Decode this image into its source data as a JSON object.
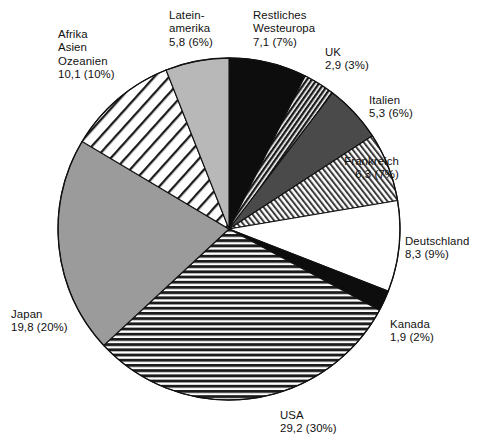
{
  "chart_data": {
    "type": "pie",
    "title": "",
    "subtitle": "",
    "xlabel": "",
    "ylabel": "",
    "legend_position": "callout-labels",
    "grid": false,
    "units": "Mio.",
    "value_decimal_separator": ",",
    "start_angle_deg": 0,
    "direction": "clockwise",
    "total_value": 97.7,
    "categories": [
      "Restliches Westeuropa",
      "UK",
      "Italien",
      "Frankreich",
      "Deutschland",
      "Kanada",
      "USA",
      "Japan",
      "Afrika Asien Ozeanien",
      "Lateinamerika"
    ],
    "values": [
      7.1,
      2.9,
      5.3,
      6.3,
      8.3,
      1.9,
      29.2,
      19.8,
      10.1,
      5.8
    ],
    "percents": [
      7,
      3,
      6,
      7,
      9,
      2,
      30,
      20,
      10,
      6
    ],
    "slices": [
      {
        "name": "Restliches Westeuropa",
        "label_lines": [
          "Restliches",
          "Westeuropa",
          "7,1 (7%)"
        ],
        "value": 7.1,
        "value_text": "7,1",
        "percent": 7,
        "percent_text": "(7%)",
        "fill": "solid-black",
        "color": "#0d0d0d"
      },
      {
        "name": "UK",
        "label_lines": [
          "UK",
          "2,9 (3%)"
        ],
        "value": 2.9,
        "value_text": "2,9",
        "percent": 3,
        "percent_text": "(3%)",
        "fill": "diagonal-dark-hatch",
        "color": "#2e2e2e"
      },
      {
        "name": "Italien",
        "label_lines": [
          "Italien",
          "5,3 (6%)"
        ],
        "value": 5.3,
        "value_text": "5,3",
        "percent": 6,
        "percent_text": "(6%)",
        "fill": "solid-dark-gray",
        "color": "#4a4a4a"
      },
      {
        "name": "Frankreich",
        "label_lines": [
          "Frankreich",
          "6,3 (7%)"
        ],
        "value": 6.3,
        "value_text": "6,3",
        "percent": 7,
        "percent_text": "(7%)",
        "fill": "diagonal-light-hatch",
        "color": "#9a9a9a"
      },
      {
        "name": "Deutschland",
        "label_lines": [
          "Deutschland",
          "8,3 (9%)"
        ],
        "value": 8.3,
        "value_text": "8,3",
        "percent": 9,
        "percent_text": "(9%)",
        "fill": "solid-white",
        "color": "#ffffff"
      },
      {
        "name": "Kanada",
        "label_lines": [
          "Kanada",
          "1,9 (2%)"
        ],
        "value": 1.9,
        "value_text": "1,9",
        "percent": 2,
        "percent_text": "(2%)",
        "fill": "solid-black",
        "color": "#0d0d0d"
      },
      {
        "name": "USA",
        "label_lines": [
          "USA",
          "29,2 (30%)"
        ],
        "value": 29.2,
        "value_text": "29,2",
        "percent": 30,
        "percent_text": "(30%)",
        "fill": "horizontal-lines",
        "color": "#8c8c8c"
      },
      {
        "name": "Japan",
        "label_lines": [
          "Japan",
          "19,8 (20%)"
        ],
        "value": 19.8,
        "value_text": "19,8",
        "percent": 20,
        "percent_text": "(20%)",
        "fill": "solid-medium-gray",
        "color": "#9b9b9b"
      },
      {
        "name": "Afrika Asien Ozeanien",
        "label_lines": [
          "Afrika",
          "Asien",
          "Ozeanien",
          "10,1 (10%)"
        ],
        "value": 10.1,
        "value_text": "10,1",
        "percent": 10,
        "percent_text": "(10%)",
        "fill": "wide-diagonal-stripes",
        "color": "#5a5a5a"
      },
      {
        "name": "Lateinamerika",
        "label_lines": [
          "Latein-",
          "amerika",
          "5,8 (6%)"
        ],
        "value": 5.8,
        "value_text": "5,8",
        "percent": 6,
        "percent_text": "(6%)",
        "fill": "solid-light-gray",
        "color": "#b8b8b8"
      }
    ]
  },
  "labels": {
    "westeuropa": {
      "l1": "Restliches",
      "l2": "Westeuropa",
      "l3": "7,1 (7%)"
    },
    "uk": {
      "l1": "UK",
      "l2": "2,9 (3%)"
    },
    "italien": {
      "l1": "Italien",
      "l2": "5,3 (6%)"
    },
    "frankreich": {
      "l1": "Frankreich",
      "l2": "6,3 (7%)"
    },
    "deutschland": {
      "l1": "Deutschland",
      "l2": "8,3 (9%)"
    },
    "kanada": {
      "l1": "Kanada",
      "l2": "1,9 (2%)"
    },
    "usa": {
      "l1": "USA",
      "l2": "29,2 (30%)"
    },
    "japan": {
      "l1": "Japan",
      "l2": "19,8 (20%)"
    },
    "afrika": {
      "l1": "Afrika",
      "l2": "Asien",
      "l3": "Ozeanien",
      "l4": "10,1 (10%)"
    },
    "lateinamerika": {
      "l1": "Latein-",
      "l2": "amerika",
      "l3": "5,8 (6%)"
    }
  },
  "caption": {
    "text": ""
  },
  "colors": {
    "outline": "#111111",
    "black": "#0d0d0d",
    "dark_gray": "#4a4a4a",
    "medium_gray": "#9b9b9b",
    "light_gray": "#b8b8b8",
    "white": "#ffffff",
    "background": "#ffffff"
  }
}
